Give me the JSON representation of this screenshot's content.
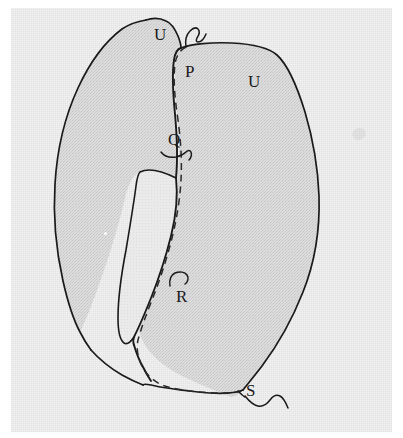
{
  "figure": {
    "background_color": "#ffffff",
    "scan_background_color": "#f2f2f2",
    "fill_color": "#d6d6d6",
    "inner_gap_fill_color": "#e9e9e9",
    "ink_color": "#1a1a1a",
    "dashed_line_color": "#2a2a2a",
    "line_width": 1.6,
    "dash_pattern": "7 5"
  },
  "labels": [
    {
      "id": "label-u-top",
      "text": "U",
      "x": 154,
      "y": 26,
      "leader": "none"
    },
    {
      "id": "label-p",
      "text": "P",
      "x": 185,
      "y": 63,
      "leader": "none"
    },
    {
      "id": "label-u-right",
      "text": "U",
      "x": 248,
      "y": 73,
      "leader": "none"
    },
    {
      "id": "label-q",
      "text": "Q",
      "x": 168,
      "y": 131,
      "leader": "hook-below"
    },
    {
      "id": "label-r",
      "text": "R",
      "x": 176,
      "y": 288,
      "leader": "hook-above"
    },
    {
      "id": "label-s",
      "text": "S",
      "x": 246,
      "y": 382,
      "leader": "squiggle-right"
    }
  ],
  "label_order": [
    "U",
    "P",
    "U",
    "Q",
    "R",
    "S"
  ],
  "annotations": {
    "leader_top_notch": "short wavy stroke between the two lobes at the apex",
    "leader_q": "small hooked stroke curving down-right beneath Q",
    "leader_r": "small hooked stroke curving up-right above R",
    "leader_s": "wavy stroke extending right from the bottom vertex near S"
  },
  "shapes": {
    "left_lobe": "narrow crescent lobe occupying the left of the figure, apex at the top near label U",
    "right_lobe": "large rounded lobe occupying the right two thirds of the figure",
    "inner_gap": "narrow lens shaped lighter gap between the two lobes near the middle",
    "dashed_margin": "dashed line tracing just inside the left and lower margin of the right lobe"
  }
}
